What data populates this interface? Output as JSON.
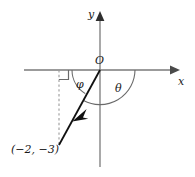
{
  "figure": {
    "type": "coordinate-diagram",
    "background_color": "#ffffff"
  },
  "axes": {
    "x_label": "x",
    "y_label": "y",
    "origin_label": "O",
    "axis_color": "#7a7a7a",
    "x_axis": {
      "x_start": 24,
      "x_end": 178,
      "y": 70
    },
    "y_axis": {
      "x": 100,
      "y_start": 12,
      "y_end": 167
    },
    "arrowheads": [
      "x-positive",
      "y-positive"
    ]
  },
  "angles": [
    {
      "name": "phi",
      "symbol": "φ",
      "from": "negative-x-axis",
      "to": "ray",
      "arc_color": "#6a6a6a"
    },
    {
      "name": "theta",
      "symbol": "θ",
      "from": "ray",
      "to": "positive-x-axis",
      "arc_color": "#6a6a6a"
    }
  ],
  "ray": {
    "label": "ray-to-point",
    "from": {
      "x": 100,
      "y": 70
    },
    "to": {
      "x": 59,
      "y": 145
    },
    "color": "#111111",
    "arrowhead": "mid-toward-point"
  },
  "point": {
    "label": "(−2, −3)",
    "coordinates": {
      "x": -2,
      "y": -3
    },
    "marker_x": 59,
    "marker_y": 145
  },
  "perpendicular": {
    "name": "dashed-drop-line",
    "x": 59,
    "y_start": 70,
    "y_end": 145,
    "style": "dashed",
    "color": "#9a9a9a"
  },
  "right_angle_marker": {
    "name": "right-angle-square",
    "x": 59,
    "y": 70,
    "size": 9,
    "color": "#6a6a6a"
  }
}
